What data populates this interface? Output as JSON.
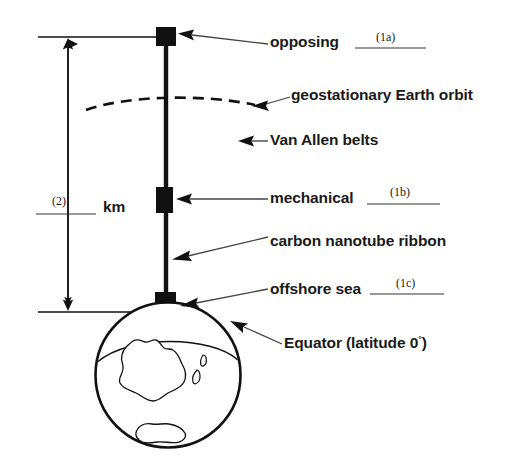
{
  "diagram": {
    "ink_color": "#111111",
    "background_color": "#ffffff",
    "callouts": [
      {
        "id": "opposing",
        "label": "opposing",
        "blank_tag": "(1a)"
      },
      {
        "id": "geo-orbit",
        "label": "geostationary Earth orbit",
        "blank_tag": ""
      },
      {
        "id": "van-allen",
        "label": "Van Allen belts",
        "blank_tag": ""
      },
      {
        "id": "mechanical",
        "label": "mechanical",
        "blank_tag": "(1b)"
      },
      {
        "id": "ribbon",
        "label": "carbon nanotube ribbon",
        "blank_tag": ""
      },
      {
        "id": "offshore-sea",
        "label": "offshore sea",
        "blank_tag": "(1c)"
      },
      {
        "id": "equator",
        "label": "Equator (latitude 0",
        "label_suffix": ")",
        "degree": "°"
      }
    ],
    "measure": {
      "tag": "(2)",
      "unit": "km"
    }
  }
}
